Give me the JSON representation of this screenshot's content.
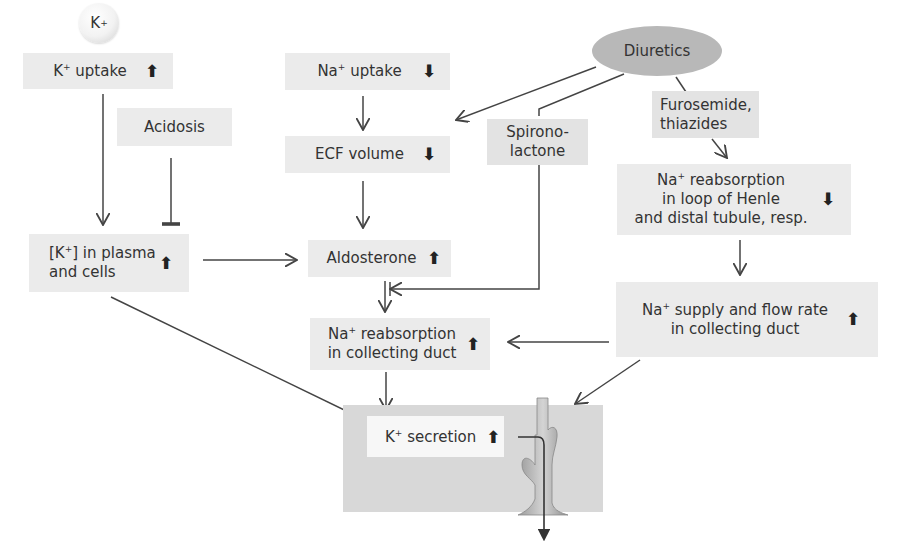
{
  "diagram": {
    "nodes": {
      "k_ion": {
        "label": "K",
        "sup": "+"
      },
      "k_uptake": {
        "label_pre": "K",
        "sup": "+",
        "label_post": " uptake",
        "direction": "up",
        "arrow": "🠅"
      },
      "acidosis": {
        "label": "Acidosis"
      },
      "k_plasma": {
        "line1_pre": "[K",
        "sup": "+",
        "line1_post": "] in plasma",
        "line2": "and cells",
        "direction": "up",
        "arrow": "🠅"
      },
      "na_uptake": {
        "label_pre": "Na",
        "sup": "+",
        "label_post": " uptake",
        "direction": "down",
        "arrow": "🠇"
      },
      "ecf_volume": {
        "label": "ECF volume",
        "direction": "down",
        "arrow": "🠇"
      },
      "aldosterone": {
        "label": "Aldosterone",
        "direction": "up",
        "arrow": "🠅"
      },
      "na_reabs_cd": {
        "line1_pre": "Na",
        "sup": "+",
        "line1_post": " reabsorption",
        "line2": "in collecting duct",
        "direction": "up",
        "arrow": "🠅"
      },
      "diuretics": {
        "label": "Diuretics"
      },
      "spironolactone": {
        "line1": "Spirono-",
        "line2": "lactone"
      },
      "furosemide": {
        "line1": "Furosemide,",
        "line2": "thiazides"
      },
      "na_reabs_henle": {
        "line1_pre": "Na",
        "sup": "+",
        "line1_post": " reabsorption",
        "line2": "in loop of Henle",
        "line3": "and distal tubule, resp.",
        "direction": "down",
        "arrow": "🠇"
      },
      "na_supply": {
        "line1_pre": "Na",
        "sup": "+",
        "line1_post": " supply and flow rate",
        "line2": "in collecting duct",
        "direction": "up",
        "arrow": "🠅"
      },
      "k_secretion": {
        "label_pre": "K",
        "sup": "+",
        "label_post": " secretion",
        "direction": "up",
        "arrow": "🠅"
      }
    },
    "edges": [
      {
        "from": "k_uptake",
        "to": "k_plasma",
        "type": "stimulates"
      },
      {
        "from": "acidosis",
        "to": "k_plasma",
        "type": "inhibits"
      },
      {
        "from": "k_plasma",
        "to": "aldosterone",
        "type": "stimulates"
      },
      {
        "from": "k_plasma",
        "to": "k_secretion",
        "type": "stimulates"
      },
      {
        "from": "na_uptake",
        "to": "ecf_volume",
        "type": "stimulates"
      },
      {
        "from": "ecf_volume",
        "to": "aldosterone",
        "type": "stimulates"
      },
      {
        "from": "diuretics",
        "to": "ecf_volume",
        "type": "stimulates"
      },
      {
        "from": "diuretics",
        "to": "spironolactone",
        "type": "link"
      },
      {
        "from": "diuretics",
        "to": "furosemide",
        "type": "link"
      },
      {
        "from": "spironolactone",
        "to": "aldosterone_effect",
        "type": "inhibits"
      },
      {
        "from": "aldosterone",
        "to": "na_reabs_cd",
        "type": "stimulates"
      },
      {
        "from": "furosemide",
        "to": "na_reabs_henle",
        "type": "stimulates"
      },
      {
        "from": "na_reabs_henle",
        "to": "na_supply",
        "type": "stimulates"
      },
      {
        "from": "na_supply",
        "to": "na_reabs_cd",
        "type": "stimulates"
      },
      {
        "from": "na_supply",
        "to": "k_secretion",
        "type": "stimulates"
      },
      {
        "from": "na_reabs_cd",
        "to": "k_secretion",
        "type": "stimulates"
      }
    ]
  }
}
